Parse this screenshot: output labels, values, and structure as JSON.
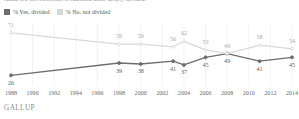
{
  "title": "Amid red-hot elections, is America more deeply divided?",
  "legend": {
    "items": [
      {
        "label": "% Yes, divided",
        "color": "#6e6e6e"
      },
      {
        "label": "% No, not divided",
        "color": "#d8d8d8"
      }
    ]
  },
  "footer": {
    "brand": "GALLUP"
  },
  "chart_data": {
    "type": "line",
    "title": "Amid red-hot elections, is America more deeply divided?",
    "xlabel": "",
    "ylabel": "",
    "ylim": [
      20,
      75
    ],
    "grid": true,
    "legend_position": "top-left",
    "x": [
      1988,
      1990,
      1992,
      1994,
      1996,
      1998,
      2000,
      2002,
      2004,
      2006,
      2008,
      2010,
      2012,
      2014
    ],
    "xticklabels": [
      "1988",
      "1990",
      "1992",
      "1994",
      "1996",
      "1998",
      "2000",
      "2002",
      "2004",
      "2006",
      "2008",
      "2010",
      "2012",
      "2014"
    ],
    "series": [
      {
        "name": "% Yes, divided",
        "color": "#6e6e6e",
        "points": [
          {
            "x": 1988,
            "y": 26,
            "label": "26"
          },
          {
            "x": 1998,
            "y": 39,
            "label": "39"
          },
          {
            "x": 2000,
            "y": 38,
            "label": "38"
          },
          {
            "x": 2003,
            "y": 41,
            "label": "41"
          },
          {
            "x": 2004,
            "y": 37,
            "label": "37"
          },
          {
            "x": 2006,
            "y": 45,
            "label": "45"
          },
          {
            "x": 2008,
            "y": 49,
            "label": "49"
          },
          {
            "x": 2011,
            "y": 41,
            "label": "41"
          },
          {
            "x": 2014,
            "y": 45,
            "label": "45"
          }
        ]
      },
      {
        "name": "% No, not divided",
        "color": "#d8d8d8",
        "points": [
          {
            "x": 1988,
            "y": 71,
            "label": "71"
          },
          {
            "x": 1998,
            "y": 59,
            "label": "59"
          },
          {
            "x": 2000,
            "y": 59,
            "label": "59"
          },
          {
            "x": 2003,
            "y": 56,
            "label": "56"
          },
          {
            "x": 2004,
            "y": 62,
            "label": "62"
          },
          {
            "x": 2006,
            "y": 53,
            "label": "53"
          },
          {
            "x": 2008,
            "y": 49,
            "label": "49"
          },
          {
            "x": 2011,
            "y": 58,
            "label": "58"
          },
          {
            "x": 2014,
            "y": 54,
            "label": "54"
          }
        ]
      }
    ]
  }
}
